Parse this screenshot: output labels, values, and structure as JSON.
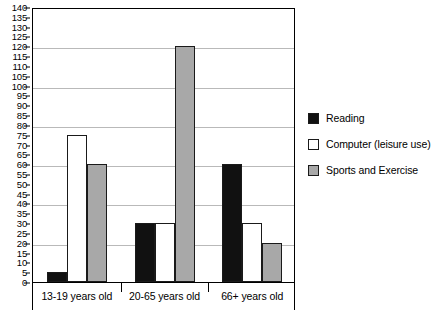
{
  "chart_data": {
    "type": "bar",
    "title": "",
    "subtitle": "",
    "xlabel": "",
    "ylabel": "",
    "categories": [
      "13-19 years old",
      "20-65 years old",
      "66+ years old"
    ],
    "series": [
      {
        "name": "Reading",
        "color": "#111111",
        "values": [
          5,
          30,
          60
        ]
      },
      {
        "name": "Computer (leisure use)",
        "color": "#ffffff",
        "values": [
          75,
          30,
          30
        ]
      },
      {
        "name": "Sports and Exercise",
        "color": "#a8a8a8",
        "values": [
          60,
          120,
          20
        ]
      }
    ],
    "ylim": [
      0,
      140
    ],
    "ytick_step": 5,
    "yticks": [
      0,
      5,
      10,
      15,
      20,
      25,
      30,
      35,
      40,
      45,
      50,
      55,
      60,
      65,
      70,
      75,
      80,
      85,
      90,
      95,
      100,
      105,
      110,
      115,
      120,
      125,
      130,
      135,
      140
    ],
    "gridline_values": [
      20,
      40,
      60,
      80,
      100,
      120,
      140
    ],
    "grid": true,
    "legend_position": "right"
  },
  "legend": {
    "entries": [
      {
        "label": "Reading",
        "swatch": "black-square-icon"
      },
      {
        "label": "Computer (leisure use)",
        "swatch": "white-square-icon"
      },
      {
        "label": "Sports and Exercise",
        "swatch": "gray-square-icon"
      }
    ]
  },
  "axis": {
    "y_tick_labels": [
      "140",
      "135",
      "130",
      "125",
      "120",
      "115",
      "110",
      "105",
      "100",
      "95",
      "90",
      "85",
      "80",
      "75",
      "70",
      "65",
      "60",
      "55",
      "50",
      "45",
      "40",
      "35",
      "30",
      "25",
      "20",
      "15",
      "10",
      "5",
      "0"
    ],
    "x_tick_labels": [
      "13-19 years old",
      "20-65 years old",
      "66+ years old"
    ]
  }
}
